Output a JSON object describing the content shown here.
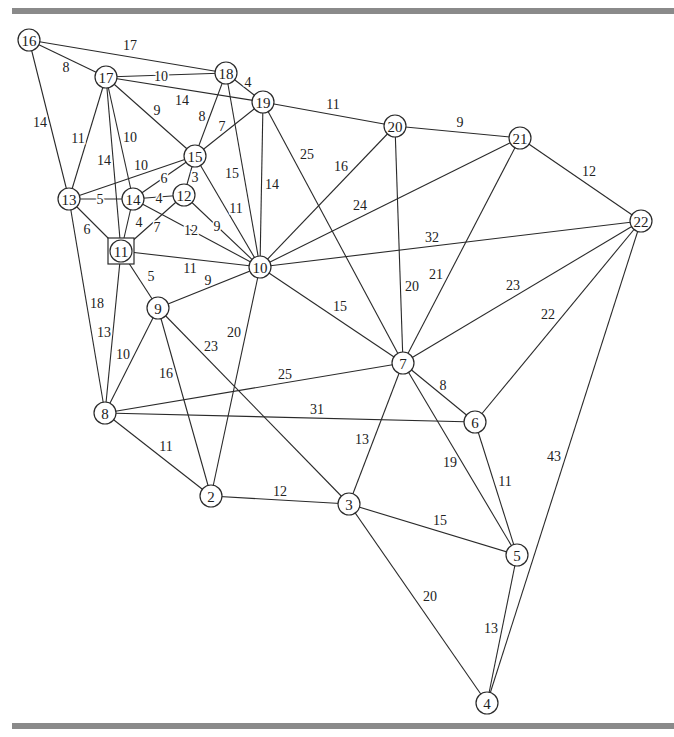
{
  "diagram": {
    "type": "weighted-undirected-graph",
    "highlighted_node": "11",
    "nodes": [
      {
        "id": "2",
        "x": 211,
        "y": 496
      },
      {
        "id": "3",
        "x": 349,
        "y": 504
      },
      {
        "id": "4",
        "x": 487,
        "y": 703
      },
      {
        "id": "5",
        "x": 517,
        "y": 555
      },
      {
        "id": "6",
        "x": 475,
        "y": 422
      },
      {
        "id": "7",
        "x": 403,
        "y": 363
      },
      {
        "id": "8",
        "x": 105,
        "y": 413
      },
      {
        "id": "9",
        "x": 158,
        "y": 308
      },
      {
        "id": "10",
        "x": 260,
        "y": 267
      },
      {
        "id": "11",
        "x": 121,
        "y": 251,
        "shape": "square"
      },
      {
        "id": "12",
        "x": 184,
        "y": 195
      },
      {
        "id": "13",
        "x": 69,
        "y": 199
      },
      {
        "id": "14",
        "x": 133,
        "y": 199
      },
      {
        "id": "15",
        "x": 195,
        "y": 156
      },
      {
        "id": "16",
        "x": 29,
        "y": 40
      },
      {
        "id": "17",
        "x": 106,
        "y": 77
      },
      {
        "id": "18",
        "x": 226,
        "y": 73
      },
      {
        "id": "19",
        "x": 263,
        "y": 102
      },
      {
        "id": "20",
        "x": 395,
        "y": 126
      },
      {
        "id": "21",
        "x": 520,
        "y": 138
      },
      {
        "id": "22",
        "x": 641,
        "y": 221
      }
    ],
    "edges": [
      {
        "from": "16",
        "to": "18",
        "weight": "17",
        "lx": 130,
        "ly": 45
      },
      {
        "from": "16",
        "to": "17",
        "weight": "8",
        "lx": 66,
        "ly": 67
      },
      {
        "from": "16",
        "to": "13",
        "weight": "14",
        "lx": 40,
        "ly": 122
      },
      {
        "from": "17",
        "to": "18",
        "weight": "10",
        "lx": 161,
        "ly": 76
      },
      {
        "from": "17",
        "to": "19",
        "weight": "14",
        "lx": 182,
        "ly": 100
      },
      {
        "from": "17",
        "to": "15",
        "weight": "9",
        "lx": 157,
        "ly": 110
      },
      {
        "from": "17",
        "to": "13",
        "weight": "11",
        "lx": 78,
        "ly": 138
      },
      {
        "from": "17",
        "to": "14",
        "weight": "10",
        "lx": 130,
        "ly": 137
      },
      {
        "from": "17",
        "to": "11",
        "weight": "14",
        "lx": 104,
        "ly": 160
      },
      {
        "from": "18",
        "to": "19",
        "weight": "4",
        "lx": 248,
        "ly": 82
      },
      {
        "from": "18",
        "to": "15",
        "weight": "8",
        "lx": 202,
        "ly": 116
      },
      {
        "from": "18",
        "to": "10",
        "weight": "15",
        "lx": 232,
        "ly": 173
      },
      {
        "from": "19",
        "to": "15",
        "weight": "7",
        "lx": 222,
        "ly": 126
      },
      {
        "from": "19",
        "to": "20",
        "weight": "11",
        "lx": 333,
        "ly": 104
      },
      {
        "from": "19",
        "to": "10",
        "weight": "14",
        "lx": 272,
        "ly": 184
      },
      {
        "from": "19",
        "to": "7",
        "weight": "25",
        "lx": 307,
        "ly": 154
      },
      {
        "from": "20",
        "to": "21",
        "weight": "9",
        "lx": 460,
        "ly": 122
      },
      {
        "from": "20",
        "to": "10",
        "weight": "16",
        "lx": 341,
        "ly": 166
      },
      {
        "from": "20",
        "to": "7",
        "weight": "20",
        "lx": 412,
        "ly": 286
      },
      {
        "from": "21",
        "to": "22",
        "weight": "12",
        "lx": 589,
        "ly": 171
      },
      {
        "from": "21",
        "to": "10",
        "weight": "24",
        "lx": 360,
        "ly": 205
      },
      {
        "from": "21",
        "to": "7",
        "weight": "21",
        "lx": 436,
        "ly": 274
      },
      {
        "from": "22",
        "to": "10",
        "weight": "32",
        "lx": 432,
        "ly": 237
      },
      {
        "from": "22",
        "to": "7",
        "weight": "23",
        "lx": 513,
        "ly": 285
      },
      {
        "from": "22",
        "to": "6",
        "weight": "22",
        "lx": 548,
        "ly": 314
      },
      {
        "from": "22",
        "to": "4",
        "weight": "43",
        "lx": 554,
        "ly": 456
      },
      {
        "from": "13",
        "to": "15",
        "weight": "10",
        "lx": 141,
        "ly": 165
      },
      {
        "from": "13",
        "to": "14",
        "weight": "5",
        "lx": 100,
        "ly": 199
      },
      {
        "from": "13",
        "to": "11",
        "weight": "6",
        "lx": 87,
        "ly": 229
      },
      {
        "from": "13",
        "to": "8",
        "weight": "18",
        "lx": 97,
        "ly": 303
      },
      {
        "from": "14",
        "to": "15",
        "weight": "6",
        "lx": 164,
        "ly": 178
      },
      {
        "from": "14",
        "to": "12",
        "weight": "4",
        "lx": 159,
        "ly": 198
      },
      {
        "from": "14",
        "to": "11",
        "weight": "4",
        "lx": 139,
        "ly": 222
      },
      {
        "from": "14",
        "to": "10",
        "weight": "12",
        "lx": 191,
        "ly": 230
      },
      {
        "from": "12",
        "to": "15",
        "weight": "3",
        "lx": 195,
        "ly": 177
      },
      {
        "from": "12",
        "to": "11",
        "weight": "7",
        "lx": 157,
        "ly": 227
      },
      {
        "from": "12",
        "to": "10",
        "weight": "9",
        "lx": 217,
        "ly": 226
      },
      {
        "from": "15",
        "to": "10",
        "weight": "11",
        "lx": 236,
        "ly": 208
      },
      {
        "from": "11",
        "to": "10",
        "weight": "11",
        "lx": 190,
        "ly": 268
      },
      {
        "from": "11",
        "to": "9",
        "weight": "5",
        "lx": 151,
        "ly": 276
      },
      {
        "from": "11",
        "to": "8",
        "weight": "13",
        "lx": 104,
        "ly": 332
      },
      {
        "from": "9",
        "to": "10",
        "weight": "9",
        "lx": 208,
        "ly": 280
      },
      {
        "from": "9",
        "to": "8",
        "weight": "10",
        "lx": 123,
        "ly": 354
      },
      {
        "from": "9",
        "to": "2",
        "weight": "16",
        "lx": 166,
        "ly": 373
      },
      {
        "from": "9",
        "to": "3",
        "weight": "23",
        "lx": 211,
        "ly": 346
      },
      {
        "from": "10",
        "to": "2",
        "weight": "20",
        "lx": 234,
        "ly": 332
      },
      {
        "from": "10",
        "to": "7",
        "weight": "15",
        "lx": 340,
        "ly": 306
      },
      {
        "from": "8",
        "to": "7",
        "weight": "25",
        "lx": 285,
        "ly": 374
      },
      {
        "from": "8",
        "to": "6",
        "weight": "31",
        "lx": 317,
        "ly": 409
      },
      {
        "from": "8",
        "to": "2",
        "weight": "11",
        "lx": 166,
        "ly": 446
      },
      {
        "from": "2",
        "to": "3",
        "weight": "12",
        "lx": 280,
        "ly": 491
      },
      {
        "from": "7",
        "to": "6",
        "weight": "8",
        "lx": 443,
        "ly": 385
      },
      {
        "from": "7",
        "to": "3",
        "weight": "13",
        "lx": 362,
        "ly": 439
      },
      {
        "from": "7",
        "to": "5",
        "weight": "19",
        "lx": 450,
        "ly": 462
      },
      {
        "from": "6",
        "to": "5",
        "weight": "11",
        "lx": 505,
        "ly": 481
      },
      {
        "from": "3",
        "to": "5",
        "weight": "15",
        "lx": 440,
        "ly": 520
      },
      {
        "from": "3",
        "to": "4",
        "weight": "20",
        "lx": 430,
        "ly": 596
      },
      {
        "from": "5",
        "to": "4",
        "weight": "13",
        "lx": 491,
        "ly": 628
      }
    ]
  }
}
